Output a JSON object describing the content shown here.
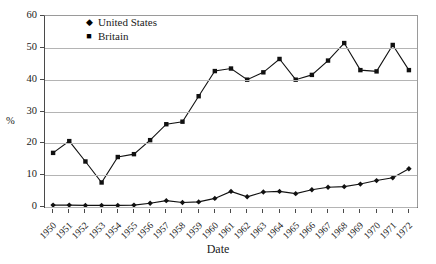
{
  "chart_data": {
    "type": "line",
    "title": "",
    "xlabel": "Date",
    "ylabel": "%",
    "ylim": [
      0,
      60
    ],
    "yticks": [
      0,
      10,
      20,
      30,
      40,
      50,
      60
    ],
    "grid": true,
    "legend_position": "top-left-inside",
    "categories": [
      "1950",
      "1951",
      "1952",
      "1953",
      "1954",
      "1955",
      "1956",
      "1957",
      "1958",
      "1959",
      "1960",
      "1961",
      "1962",
      "1963",
      "1964",
      "1965",
      "1966",
      "1967",
      "1968",
      "1969",
      "1970",
      "1971",
      "1972"
    ],
    "series": [
      {
        "name": "United States",
        "marker": "diamond",
        "values": [
          0.6,
          0.6,
          0.5,
          0.5,
          0.5,
          0.6,
          1.2,
          2.0,
          1.4,
          1.6,
          2.7,
          4.9,
          3.2,
          4.7,
          4.9,
          4.2,
          5.4,
          6.2,
          6.4,
          7.2,
          8.3,
          9.2,
          12.0
        ]
      },
      {
        "name": "Britain",
        "marker": "square",
        "values": [
          17.0,
          20.7,
          14.3,
          7.7,
          15.7,
          16.6,
          21.0,
          26.0,
          26.8,
          34.8,
          42.7,
          43.5,
          40.0,
          42.3,
          46.5,
          40.0,
          41.5,
          46.0,
          51.5,
          43.0,
          42.6,
          50.9,
          43.0
        ]
      }
    ]
  },
  "legend": {
    "items": [
      {
        "label": "United States",
        "glyph": "◆"
      },
      {
        "label": "Britain",
        "glyph": "■"
      }
    ]
  },
  "axes": {
    "x_title": "Date",
    "y_title": "%"
  }
}
